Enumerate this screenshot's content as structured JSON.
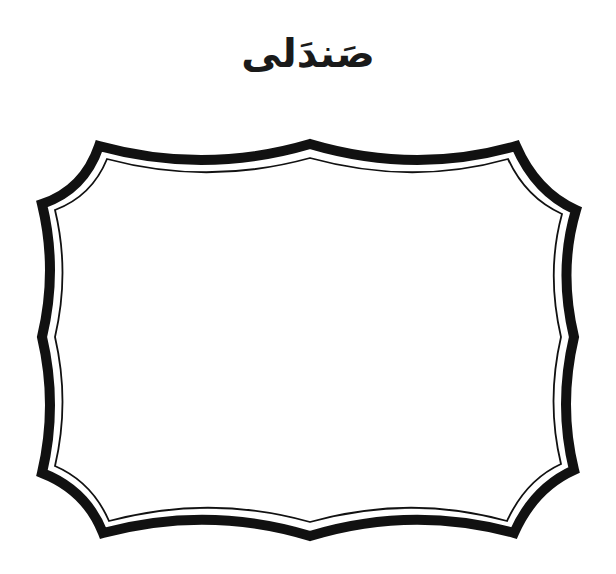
{
  "worksheet": {
    "title": "صَندَلی",
    "frame": {
      "shape": "decorative-scalloped-frame",
      "outer_color": "#111111",
      "inner_line_color": "#111111",
      "fill": "#ffffff"
    }
  }
}
